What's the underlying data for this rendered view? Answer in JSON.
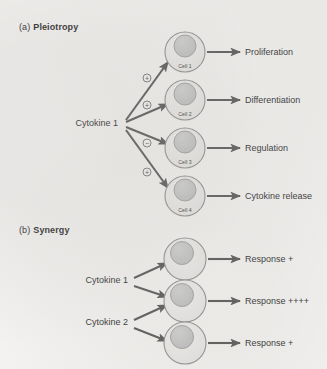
{
  "figure": {
    "background_color": "#f3f2f0",
    "line_color": "#555555",
    "cell_fill": "#e9e8e6",
    "cell_stroke": "#8d8d8d",
    "nucleus_fill": "#c2c2c2",
    "nucleus_stroke": "#9a9a9a"
  },
  "panels": [
    {
      "id": "pleiotropy",
      "tag": "(a)",
      "name": "Pleiotropy",
      "source_labels": [
        {
          "text": "Cytokine 1",
          "x": 118,
          "y": 126
        }
      ],
      "cells": [
        {
          "label": "Cell 1",
          "cx": 185,
          "cy": 52,
          "r": 20,
          "nucleus_cx": 185,
          "nucleus_cy": 46,
          "nucleus_r": 11
        },
        {
          "label": "Cell 2",
          "cx": 185,
          "cy": 100,
          "r": 20,
          "nucleus_cx": 185,
          "nucleus_cy": 94,
          "nucleus_r": 11
        },
        {
          "label": "Cell 3",
          "cx": 185,
          "cy": 148,
          "r": 20,
          "nucleus_cx": 185,
          "nucleus_cy": 142,
          "nucleus_r": 11
        },
        {
          "label": "Cell 4",
          "cx": 185,
          "cy": 196,
          "r": 20,
          "nucleus_cx": 185,
          "nucleus_cy": 190,
          "nucleus_r": 11
        }
      ],
      "signal_arrows": [
        {
          "sign": "+",
          "from_x": 126,
          "from_y": 120,
          "to_x": 168,
          "to_y": 62,
          "badge_x": 147,
          "badge_y": 78
        },
        {
          "sign": "+",
          "from_x": 126,
          "from_y": 122,
          "to_x": 168,
          "to_y": 104,
          "badge_x": 147,
          "badge_y": 105
        },
        {
          "sign": "−",
          "from_x": 126,
          "from_y": 127,
          "to_x": 168,
          "to_y": 144,
          "badge_x": 147,
          "badge_y": 143
        },
        {
          "sign": "+",
          "from_x": 126,
          "from_y": 130,
          "to_x": 168,
          "to_y": 188,
          "badge_x": 147,
          "badge_y": 172
        }
      ],
      "responses": [
        {
          "text": "Proliferation",
          "arrow_from_x": 207,
          "arrow_from_y": 52,
          "arrow_to_x": 240,
          "arrow_to_y": 52,
          "label_x": 245,
          "label_y": 55
        },
        {
          "text": "Differentiation",
          "arrow_from_x": 207,
          "arrow_from_y": 100,
          "arrow_to_x": 240,
          "arrow_to_y": 100,
          "label_x": 245,
          "label_y": 103
        },
        {
          "text": "Regulation",
          "arrow_from_x": 207,
          "arrow_from_y": 148,
          "arrow_to_x": 240,
          "arrow_to_y": 148,
          "label_x": 245,
          "label_y": 151
        },
        {
          "text": "Cytokine release",
          "arrow_from_x": 207,
          "arrow_from_y": 196,
          "arrow_to_x": 240,
          "arrow_to_y": 196,
          "label_x": 245,
          "label_y": 199
        }
      ]
    },
    {
      "id": "synergy",
      "tag": "(b)",
      "name": "Synergy",
      "source_labels": [
        {
          "text": "Cytokine 1",
          "x": 128,
          "y": 283
        },
        {
          "text": "Cytokine 2",
          "x": 128,
          "y": 325
        }
      ],
      "cells": [
        {
          "label": "",
          "cx": 185,
          "cy": 259,
          "r": 21,
          "nucleus_cx": 182,
          "nucleus_cy": 253,
          "nucleus_r": 11.5
        },
        {
          "label": "",
          "cx": 185,
          "cy": 301,
          "r": 21,
          "nucleus_cx": 182,
          "nucleus_cy": 295,
          "nucleus_r": 11.5
        },
        {
          "label": "",
          "cx": 185,
          "cy": 343,
          "r": 21,
          "nucleus_cx": 182,
          "nucleus_cy": 337,
          "nucleus_r": 11.5
        }
      ],
      "signal_arrows": [
        {
          "sign": "",
          "from_x": 134,
          "from_y": 278,
          "to_x": 167,
          "to_y": 263
        },
        {
          "sign": "",
          "from_x": 134,
          "from_y": 286,
          "to_x": 167,
          "to_y": 297
        },
        {
          "sign": "",
          "from_x": 134,
          "from_y": 320,
          "to_x": 167,
          "to_y": 305
        },
        {
          "sign": "",
          "from_x": 134,
          "from_y": 328,
          "to_x": 167,
          "to_y": 341
        }
      ],
      "responses": [
        {
          "text": "Response  +",
          "arrow_from_x": 208,
          "arrow_from_y": 259,
          "arrow_to_x": 240,
          "arrow_to_y": 259,
          "label_x": 245,
          "label_y": 262
        },
        {
          "text": "Response  ++++",
          "arrow_from_x": 208,
          "arrow_from_y": 301,
          "arrow_to_x": 240,
          "arrow_to_y": 301,
          "label_x": 245,
          "label_y": 304
        },
        {
          "text": "Response  +",
          "arrow_from_x": 208,
          "arrow_from_y": 343,
          "arrow_to_x": 240,
          "arrow_to_y": 343,
          "label_x": 245,
          "label_y": 346
        }
      ]
    }
  ]
}
